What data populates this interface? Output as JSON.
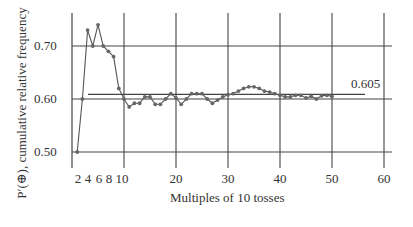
{
  "chart_data": {
    "type": "line",
    "title": "",
    "xlabel": "Multiples of 10 tosses",
    "ylabel": "P′(⊕), cumulative relative frequency",
    "x": [
      1,
      2,
      3,
      4,
      5,
      6,
      7,
      8,
      9,
      10,
      11,
      12,
      13,
      14,
      15,
      16,
      17,
      18,
      19,
      20,
      21,
      22,
      23,
      24,
      25,
      26,
      27,
      28,
      29,
      30,
      31,
      32,
      33,
      34,
      35,
      36,
      37,
      38,
      39,
      40,
      41,
      42,
      43,
      44,
      45,
      46,
      47,
      48,
      49,
      50
    ],
    "series": [
      {
        "name": "cumulative relative frequency",
        "values": [
          0.5,
          0.6,
          0.73,
          0.7,
          0.74,
          0.7,
          0.69,
          0.68,
          0.62,
          0.6,
          0.585,
          0.592,
          0.592,
          0.604,
          0.604,
          0.59,
          0.59,
          0.6,
          0.61,
          0.602,
          0.59,
          0.6,
          0.61,
          0.61,
          0.61,
          0.6,
          0.592,
          0.598,
          0.604,
          0.608,
          0.61,
          0.615,
          0.62,
          0.623,
          0.623,
          0.62,
          0.615,
          0.613,
          0.61,
          0.607,
          0.604,
          0.604,
          0.607,
          0.607,
          0.602,
          0.605,
          0.6,
          0.606,
          0.607,
          0.605
        ]
      }
    ],
    "reference_line": {
      "value": 0.605,
      "label": "0.605"
    },
    "xlim": [
      0,
      62
    ],
    "ylim": [
      0.45,
      0.76
    ],
    "x_tick_labels": [
      "2",
      "4",
      "6",
      "8",
      "10",
      "20",
      "30",
      "40",
      "50",
      "60"
    ],
    "x_ticks": [
      2,
      4,
      6,
      8,
      10,
      20,
      30,
      40,
      50,
      60
    ],
    "y_tick_labels": [
      "0.50",
      "0.60",
      "0.70"
    ],
    "y_ticks": [
      0.5,
      0.6,
      0.7
    ],
    "grid": true,
    "legend": "none"
  },
  "labels": {
    "ylabel": "P′(⊕), cumulative relative frequency",
    "xlabel": "Multiples of 10 tosses",
    "reference": "0.605",
    "y_ticks": [
      "0.50",
      "0.60",
      "0.70"
    ],
    "x_ticks_small": [
      "2",
      "4",
      "6",
      "8",
      "10"
    ],
    "x_ticks_big": [
      "20",
      "30",
      "40",
      "50",
      "60"
    ]
  }
}
